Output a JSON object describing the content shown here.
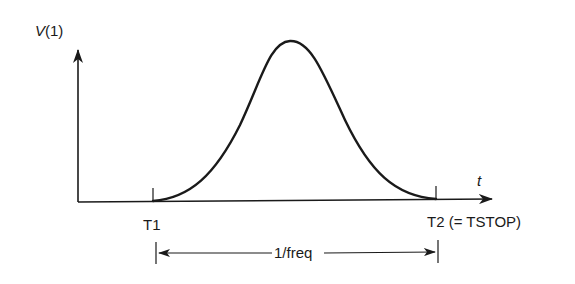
{
  "diagram": {
    "y_axis_label": "V(1)",
    "x_axis_label": "t",
    "start_marker": "T1",
    "end_marker": "T2 (= TSTOP)",
    "period_label": "1/freq",
    "curve_shape": "bell-shaped pulse from T1 to T2",
    "line_color": "#1a1a1a"
  }
}
